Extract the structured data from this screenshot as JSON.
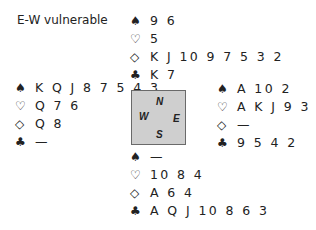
{
  "vulnerability": "E-W vulnerable",
  "suit_symbols": {
    "spades": "♠",
    "hearts": "♡",
    "diamonds": "◇",
    "clubs": "♣"
  },
  "compass": {
    "north": "N",
    "west": "W",
    "east": "E",
    "south": "S"
  },
  "hands": {
    "north": {
      "spades": "9 6",
      "hearts": "5",
      "diamonds": "K J 10 9 7 5 3 2",
      "clubs": "K 7"
    },
    "west": {
      "spades": "K Q J 8 7 5 4 3",
      "hearts": "Q 7 6",
      "diamonds": "Q 8",
      "clubs": "—"
    },
    "east": {
      "spades": "A 10 2",
      "hearts": "A K J 9 3 2",
      "diamonds": "—",
      "clubs": "9 5 4 2"
    },
    "south": {
      "spades": "—",
      "hearts": "10 8 4",
      "diamonds": "A 6 4",
      "clubs": "A Q J 10 8 6 3"
    }
  }
}
